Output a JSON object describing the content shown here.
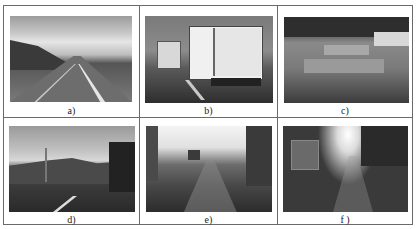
{
  "figure": {
    "layout": "2x3 image grid",
    "panels": [
      {
        "id": "a",
        "caption": "a)",
        "description": "Highway with mountains under cloudy sky, daytime"
      },
      {
        "id": "b",
        "caption": "b)",
        "description": "Road with two white trucks ahead"
      },
      {
        "id": "c",
        "caption": "c)",
        "description": "Road with patched asphalt surface and guardrail, trees in background"
      },
      {
        "id": "d",
        "caption": "d)",
        "description": "Road with streetlight, hills and trees, cloudy sky"
      },
      {
        "id": "e",
        "caption": "e)",
        "description": "Overexposed road with bright sky, vehicle in distance"
      },
      {
        "id": "f",
        "caption": "f )",
        "description": "Night road with strong oncoming headlight glare, vehicle on left"
      }
    ]
  },
  "colors": {
    "border": "#6a6a6a",
    "background": "#ffffff",
    "caption_text": "#222222"
  }
}
